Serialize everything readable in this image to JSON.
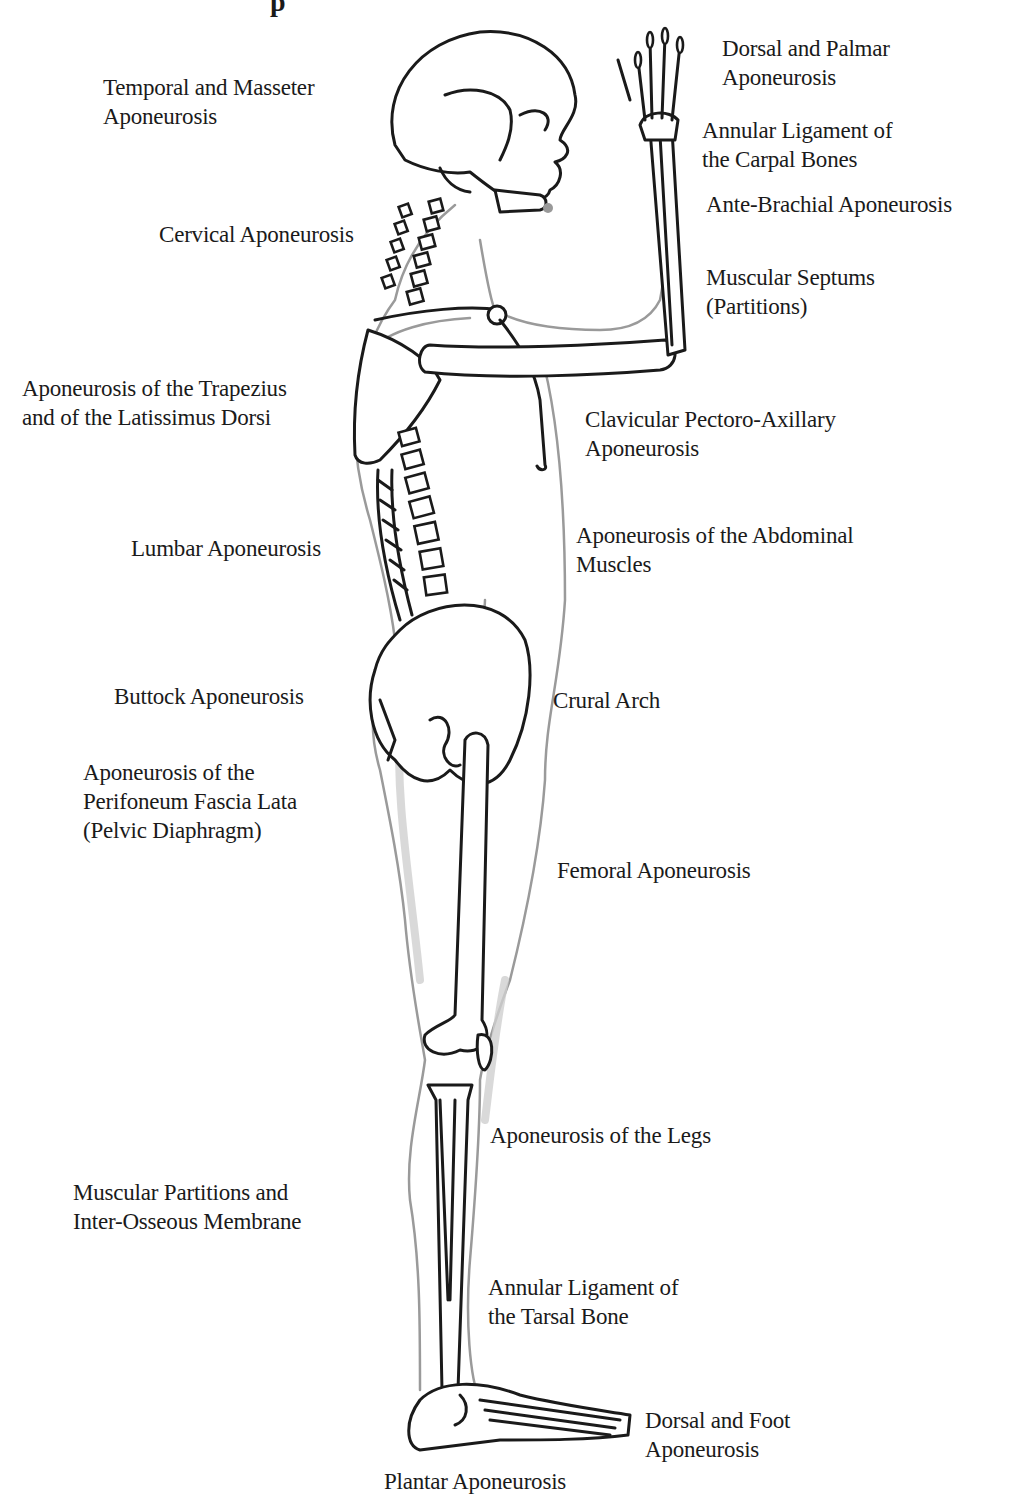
{
  "figure": {
    "title_fragment": "p"
  },
  "labels": {
    "temporal": [
      "Temporal and Masseter",
      "Aponeurosis"
    ],
    "cervical": [
      "Cervical Aponeurosis"
    ],
    "trapezius": [
      "Aponeurosis of the Trapezius",
      "and of the Latissimus Dorsi"
    ],
    "lumbar": [
      "Lumbar Aponeurosis"
    ],
    "buttock": [
      "Buttock Aponeurosis"
    ],
    "perineum": [
      "Aponeurosis of the",
      "Perifoneum Fascia Lata",
      "(Pelvic Diaphragm)"
    ],
    "muscular_partitions": [
      "Muscular Partitions and",
      "Inter-Osseous Membrane"
    ],
    "plantar": [
      "Plantar Aponeurosis"
    ],
    "dorsal_palmar": [
      "Dorsal and Palmar",
      "Aponeurosis"
    ],
    "annular_carpal": [
      "Annular Ligament of",
      "the Carpal Bones"
    ],
    "ante_brachial": [
      "Ante-Brachial Aponeurosis"
    ],
    "muscular_septums": [
      "Muscular Septums",
      "(Partitions)"
    ],
    "clavicular": [
      "Clavicular Pectoro-Axillary",
      "Aponeurosis"
    ],
    "abdominal": [
      "Aponeurosis of the Abdominal",
      "Muscles"
    ],
    "crural": [
      "Crural Arch"
    ],
    "femoral": [
      "Femoral Aponeurosis"
    ],
    "legs": [
      "Aponeurosis of the Legs"
    ],
    "annular_tarsal": [
      "Annular Ligament of",
      "the Tarsal Bone"
    ],
    "dorsal_foot": [
      "Dorsal and Foot",
      "Aponeurosis"
    ]
  },
  "colors": {
    "bone_outline": "#1a1a1a",
    "body_outline": "#9a9a9a",
    "background": "#ffffff"
  }
}
